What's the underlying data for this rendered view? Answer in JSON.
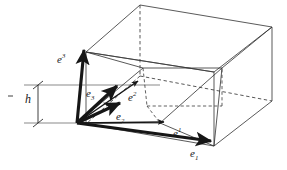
{
  "figure": {
    "background": "#ffffff",
    "ink": "#161616",
    "guide_color": "#8a8a8a",
    "dash_color": "#3a3a3a",
    "thin_color": "#3c3c3c"
  },
  "labels": {
    "e_sup_3": {
      "base": "e",
      "index": "3",
      "kind": "superscript",
      "x": 57,
      "y": 53
    },
    "e_sup_2": {
      "base": "e",
      "index": "2",
      "kind": "superscript",
      "x": 128,
      "y": 91
    },
    "e_sup_1": {
      "base": "e",
      "index": "1",
      "kind": "superscript",
      "x": 173,
      "y": 127
    },
    "e_sub_3": {
      "base": "e",
      "index": "3",
      "kind": "subscript",
      "x": 86,
      "y": 88
    },
    "e_sub_2": {
      "base": "e",
      "index": "2",
      "kind": "subscript",
      "x": 116,
      "y": 111
    },
    "e_sub_1": {
      "base": "e",
      "index": "1",
      "kind": "subscript",
      "x": 190,
      "y": 148
    },
    "height": {
      "base": "h",
      "index": "",
      "kind": "plain",
      "x": 25,
      "y": 93
    }
  },
  "geometry": {
    "origin": {
      "x": 77,
      "y": 123
    },
    "box_top_face": [
      {
        "x": 86,
        "y": 52
      },
      {
        "x": 140,
        "y": 5
      },
      {
        "x": 272,
        "y": 27
      },
      {
        "x": 214,
        "y": 72
      }
    ],
    "box_hidden_vertical": {
      "x": 140,
      "y": 5,
      "x2": 140,
      "y2": 75
    },
    "cell_top_face": [
      {
        "x": 77,
        "y": 123
      },
      {
        "x": 143,
        "y": 68
      },
      {
        "x": 222,
        "y": 68
      },
      {
        "x": 160,
        "y": 123
      }
    ],
    "contravariant_vectors": [
      {
        "name": "e-sup-1",
        "from": {
          "x": 77,
          "y": 123
        },
        "to": {
          "x": 166,
          "y": 122
        }
      },
      {
        "name": "e-sup-2",
        "from": {
          "x": 77,
          "y": 123
        },
        "to": {
          "x": 139,
          "y": 80
        }
      },
      {
        "name": "e-sup-3",
        "from": {
          "x": 77,
          "y": 123
        },
        "to": {
          "x": 85,
          "y": 48
        }
      }
    ],
    "covariant_vectors": [
      {
        "name": "e-sub-1",
        "from": {
          "x": 77,
          "y": 123
        },
        "to": {
          "x": 214,
          "y": 142
        }
      },
      {
        "name": "e-sub-2",
        "from": {
          "x": 77,
          "y": 123
        },
        "to": {
          "x": 122,
          "y": 102
        }
      },
      {
        "name": "e-sub-3",
        "from": {
          "x": 77,
          "y": 123
        },
        "to": {
          "x": 119,
          "y": 85
        }
      }
    ],
    "height_guides": {
      "upper_line": {
        "x1": 24,
        "y1": 85,
        "x2": 160,
        "y2": 85
      },
      "lower_line": {
        "x1": 24,
        "y1": 123,
        "x2": 120,
        "y2": 123
      },
      "measure_axis": {
        "x": 38,
        "y1": 85,
        "y2": 123
      },
      "tick_half_width": 5
    }
  }
}
